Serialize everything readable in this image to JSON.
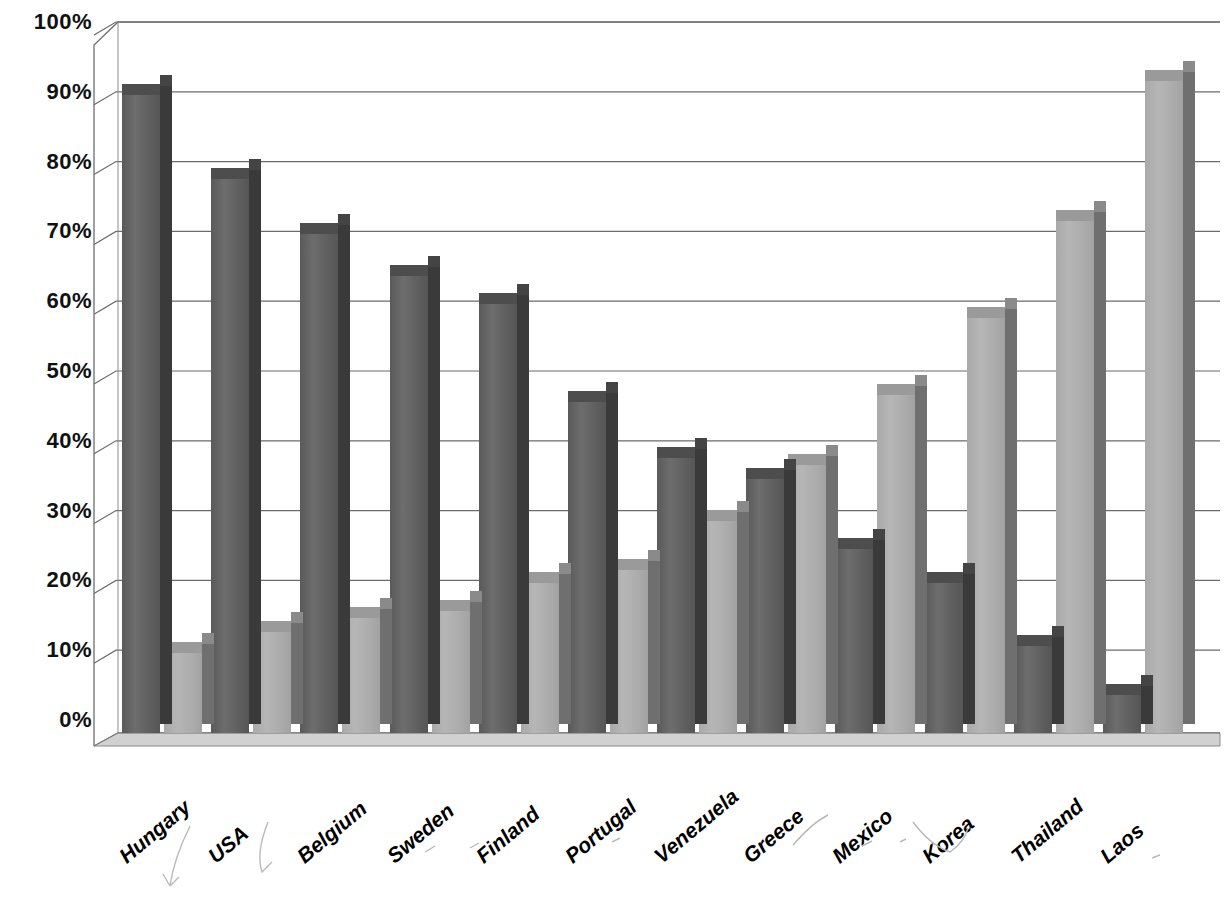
{
  "chart_data": {
    "type": "bar",
    "title": "",
    "subtitle": "",
    "xlabel": "",
    "ylabel": "",
    "ylim": [
      0,
      100
    ],
    "ytick_labels": [
      "0%",
      "10%",
      "20%",
      "30%",
      "40%",
      "50%",
      "60%",
      "70%",
      "80%",
      "90%",
      "100%"
    ],
    "ytick_values": [
      0,
      10,
      20,
      30,
      40,
      50,
      60,
      70,
      80,
      90,
      100
    ],
    "grid": true,
    "grid_axis": "y",
    "legend": false,
    "legend_position": "none",
    "style": "3d-clustered-column",
    "categories": [
      "Hungary",
      "USA",
      "Belgium",
      "Sweden",
      "Finland",
      "Portugal",
      "Venezuela",
      "Greece",
      "Mexico",
      "Korea",
      "Thailand",
      "Laos"
    ],
    "series": [
      {
        "name": "Series 1",
        "color": "#5e5e5e",
        "values": [
          93,
          81,
          73,
          67,
          63,
          49,
          41,
          38,
          28,
          23,
          14,
          7
        ]
      },
      {
        "name": "Series 2",
        "color": "#acacac",
        "values": [
          13,
          16,
          18,
          19,
          23,
          25,
          32,
          40,
          50,
          61,
          75,
          95
        ]
      }
    ]
  },
  "colors": {
    "series_dark": "#5e5e5e",
    "series_light": "#acacac",
    "grid_line": "#6b6b6b",
    "axis_line": "#555555",
    "background": "#ffffff",
    "text": "#000000"
  }
}
